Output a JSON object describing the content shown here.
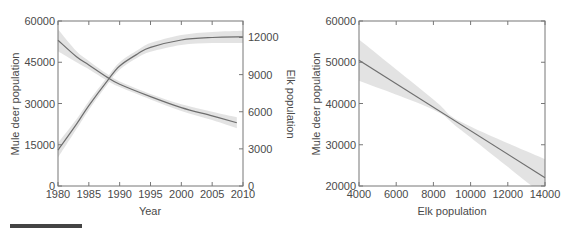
{
  "chart_data": [
    {
      "type": "line",
      "title": "",
      "xlabel": "Year",
      "ylabel": "Mule deer population",
      "y2label": "Elk population",
      "xlim": [
        1980,
        2010
      ],
      "ylim": [
        0,
        60000
      ],
      "y2lim": [
        0,
        13333
      ],
      "x_ticks": [
        "1980",
        "1985",
        "1990",
        "1995",
        "2000",
        "2005",
        "2010"
      ],
      "y_ticks": [
        "0",
        "15000",
        "30000",
        "45000",
        "60000"
      ],
      "y2_ticks": [
        "0",
        "3000",
        "6000",
        "9000",
        "12000"
      ],
      "grid": false,
      "series": [
        {
          "name": "Mule deer population",
          "axis": "left",
          "x": [
            1980,
            1983,
            1985,
            1988,
            1990,
            1995,
            2000,
            2005,
            2009
          ],
          "values": [
            53000,
            47000,
            44000,
            39500,
            37000,
            32500,
            28500,
            25500,
            23000
          ],
          "ci_half_width": [
            4000,
            2000,
            1500,
            1200,
            1000,
            1000,
            1200,
            1500,
            2000
          ]
        },
        {
          "name": "Elk population",
          "axis": "right",
          "x": [
            1980,
            1983,
            1985,
            1988,
            1990,
            1993,
            1995,
            2000,
            2005,
            2010
          ],
          "values": [
            2900,
            5000,
            6500,
            8500,
            9700,
            10700,
            11200,
            11800,
            12000,
            12050
          ],
          "ci_half_width": [
            600,
            400,
            350,
            300,
            300,
            300,
            350,
            400,
            450,
            500
          ]
        }
      ]
    },
    {
      "type": "line",
      "title": "",
      "xlabel": "Elk population",
      "ylabel": "Mule deer population",
      "xlim": [
        4000,
        14000
      ],
      "ylim": [
        20000,
        60000
      ],
      "x_ticks": [
        "4000",
        "6000",
        "8000",
        "10000",
        "12000",
        "14000"
      ],
      "y_ticks": [
        "20000",
        "30000",
        "40000",
        "50000",
        "60000"
      ],
      "grid": false,
      "series": [
        {
          "name": "Fitted relationship",
          "x": [
            4000,
            14000
          ],
          "values": [
            50500,
            22000
          ],
          "ci_lower": [
            45500,
            38500,
            33500,
            17500
          ],
          "ci_upper": [
            55500,
            41000,
            35500,
            26500
          ],
          "ci_x": [
            4000,
            8000,
            9500,
            14000
          ]
        }
      ]
    }
  ]
}
